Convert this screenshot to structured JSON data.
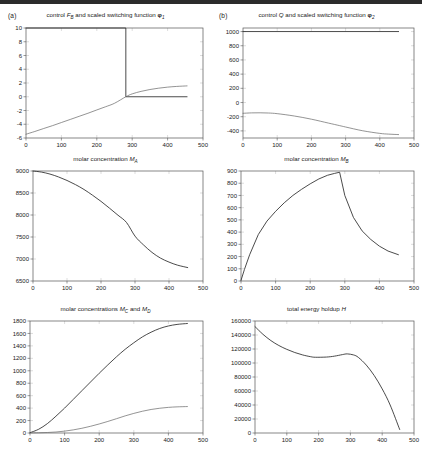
{
  "figure": {
    "panel_a_tag": "(a)",
    "panel_b_tag": "(b)",
    "background": "#ffffff",
    "curve_color": "#2a2a2a",
    "axis_color": "#555555"
  },
  "chart_data": [
    {
      "id": "control-FB-phi1",
      "type": "line",
      "title": "control F_B and scaled switching function φ₁",
      "title_parts": {
        "prefix": "control",
        "var": "F",
        "var_sub": "B",
        "mid": "and scaled switching function",
        "sym": "φ",
        "sym_sub": "1"
      },
      "panel": "(a)",
      "xlabel": "",
      "ylabel": "",
      "xlim": [
        0,
        500
      ],
      "ylim": [
        -6,
        10
      ],
      "xticks": [
        0,
        100,
        200,
        300,
        400,
        500
      ],
      "yticks": [
        -6,
        -4,
        -2,
        0,
        2,
        4,
        6,
        8,
        10
      ],
      "grid": true,
      "legend": "none",
      "annotations": [
        "bang-bang switch at t ≈ 282"
      ],
      "series": [
        {
          "name": "F_B (control)",
          "style": "solid-thick",
          "x": [
            0,
            282,
            282,
            455
          ],
          "values": [
            10,
            10,
            0,
            0
          ]
        },
        {
          "name": "φ₁ (scaled switching function)",
          "style": "solid-thin",
          "x": [
            0,
            25,
            50,
            75,
            100,
            125,
            150,
            175,
            200,
            225,
            250,
            282,
            300,
            325,
            350,
            375,
            400,
            425,
            455
          ],
          "values": [
            -5.45,
            -5.05,
            -4.62,
            -4.2,
            -3.75,
            -3.3,
            -2.85,
            -2.4,
            -1.92,
            -1.45,
            -0.95,
            0.0,
            0.42,
            0.78,
            1.05,
            1.25,
            1.4,
            1.5,
            1.58
          ]
        }
      ]
    },
    {
      "id": "control-Q-phi2",
      "type": "line",
      "title": "control Q and scaled switching function φ₂",
      "title_parts": {
        "prefix": "control",
        "var": "Q",
        "var_sub": "",
        "mid": "and scaled switching function",
        "sym": "φ",
        "sym_sub": "2"
      },
      "panel": "(b)",
      "xlabel": "",
      "ylabel": "",
      "xlim": [
        0,
        500
      ],
      "ylim": [
        -500,
        1050
      ],
      "xticks": [
        0,
        100,
        200,
        300,
        400,
        500
      ],
      "yticks": [
        -400,
        -200,
        0,
        200,
        400,
        600,
        800,
        1000
      ],
      "grid": true,
      "legend": "none",
      "series": [
        {
          "name": "Q (control)",
          "style": "solid-thick",
          "x": [
            0,
            455
          ],
          "values": [
            1000,
            1000
          ]
        },
        {
          "name": "φ₂ (scaled switching function)",
          "style": "solid-thin",
          "x": [
            0,
            25,
            50,
            75,
            100,
            150,
            200,
            250,
            282,
            300,
            350,
            400,
            425,
            455
          ],
          "values": [
            -152,
            -146,
            -145,
            -148,
            -157,
            -190,
            -235,
            -290,
            -325,
            -345,
            -398,
            -435,
            -445,
            -452
          ]
        }
      ]
    },
    {
      "id": "molar-concentration-MA",
      "type": "line",
      "title": "molar concentration M_A",
      "title_parts": {
        "prefix": "molar concentration",
        "var": "M",
        "var_sub": "A"
      },
      "xlabel": "",
      "ylabel": "",
      "xlim": [
        0,
        500
      ],
      "ylim": [
        6500,
        9000
      ],
      "xticks": [
        0,
        100,
        200,
        300,
        400,
        500
      ],
      "yticks": [
        6500,
        7000,
        7500,
        8000,
        8500,
        9000
      ],
      "grid": true,
      "legend": "none",
      "series": [
        {
          "name": "M_A",
          "style": "solid-thick",
          "x": [
            0,
            25,
            50,
            75,
            100,
            125,
            150,
            175,
            200,
            225,
            250,
            275,
            300,
            325,
            350,
            375,
            400,
            425,
            455
          ],
          "values": [
            9000,
            8975,
            8930,
            8865,
            8785,
            8690,
            8580,
            8450,
            8310,
            8155,
            7995,
            7830,
            7520,
            7320,
            7150,
            7020,
            6930,
            6860,
            6805
          ]
        }
      ]
    },
    {
      "id": "molar-concentration-MB",
      "type": "line",
      "title": "molar concentration M_B",
      "title_parts": {
        "prefix": "molar concentration",
        "var": "M",
        "var_sub": "B"
      },
      "xlabel": "",
      "ylabel": "",
      "xlim": [
        0,
        500
      ],
      "ylim": [
        0,
        900
      ],
      "xticks": [
        0,
        100,
        200,
        300,
        400,
        500
      ],
      "yticks": [
        0,
        100,
        200,
        300,
        400,
        500,
        600,
        700,
        800,
        900
      ],
      "grid": true,
      "legend": "none",
      "annotations": [
        "peak ≈ 890 at t ≈ 285"
      ],
      "series": [
        {
          "name": "M_B",
          "style": "solid-thick",
          "x": [
            0,
            10,
            25,
            50,
            75,
            100,
            125,
            150,
            175,
            200,
            225,
            250,
            270,
            285,
            300,
            325,
            350,
            375,
            400,
            425,
            455
          ],
          "values": [
            5,
            95,
            215,
            380,
            490,
            570,
            640,
            700,
            750,
            795,
            835,
            865,
            880,
            890,
            700,
            520,
            410,
            340,
            285,
            245,
            215
          ]
        }
      ]
    },
    {
      "id": "molar-concentrations-MC-MD",
      "type": "line",
      "title": "molar concentrations M_C and M_D",
      "title_parts": {
        "prefix": "molar concentrations",
        "var": "M",
        "var_sub": "C",
        "mid": "and",
        "var2": "M",
        "var2_sub": "D"
      },
      "xlabel": "",
      "ylabel": "",
      "xlim": [
        0,
        500
      ],
      "ylim": [
        0,
        1800
      ],
      "xticks": [
        0,
        100,
        200,
        300,
        400,
        500
      ],
      "yticks": [
        0,
        200,
        400,
        600,
        800,
        1000,
        1200,
        1400,
        1600,
        1800
      ],
      "grid": true,
      "legend": "none",
      "series": [
        {
          "name": "M_C",
          "style": "solid-thick",
          "x": [
            0,
            25,
            50,
            75,
            100,
            125,
            150,
            175,
            200,
            225,
            250,
            275,
            300,
            325,
            350,
            375,
            400,
            425,
            455
          ],
          "values": [
            5,
            60,
            150,
            270,
            400,
            540,
            680,
            820,
            960,
            1095,
            1225,
            1345,
            1450,
            1545,
            1620,
            1680,
            1720,
            1745,
            1760
          ]
        },
        {
          "name": "M_D",
          "style": "solid-thin",
          "x": [
            0,
            25,
            50,
            75,
            100,
            125,
            150,
            175,
            200,
            225,
            250,
            275,
            300,
            325,
            350,
            375,
            400,
            425,
            455
          ],
          "values": [
            2,
            4,
            8,
            16,
            30,
            50,
            76,
            108,
            145,
            186,
            230,
            275,
            315,
            350,
            378,
            398,
            412,
            420,
            425
          ]
        }
      ]
    },
    {
      "id": "total-energy-holdup-H",
      "type": "line",
      "title": "total energy holdup H",
      "title_parts": {
        "prefix": "total energy holdup",
        "var": "H",
        "var_sub": ""
      },
      "xlabel": "",
      "ylabel": "",
      "xlim": [
        0,
        500
      ],
      "ylim": [
        0,
        160000
      ],
      "xticks": [
        0,
        100,
        200,
        300,
        400,
        500
      ],
      "yticks": [
        0,
        20000,
        40000,
        60000,
        80000,
        100000,
        120000,
        140000,
        160000
      ],
      "grid": true,
      "legend": "none",
      "annotations": [
        "local min ≈ 108000 at t ≈ 190",
        "local max ≈ 113000 at t ≈ 290"
      ],
      "series": [
        {
          "name": "H",
          "style": "solid-thick",
          "x": [
            0,
            25,
            50,
            75,
            100,
            125,
            150,
            175,
            190,
            225,
            250,
            275,
            290,
            310,
            325,
            350,
            375,
            400,
            425,
            455
          ],
          "values": [
            152000,
            141000,
            132000,
            125000,
            119500,
            115000,
            111500,
            109000,
            108200,
            108500,
            109800,
            112000,
            113000,
            111500,
            108000,
            97000,
            82000,
            63000,
            40000,
            5000
          ]
        }
      ]
    }
  ]
}
